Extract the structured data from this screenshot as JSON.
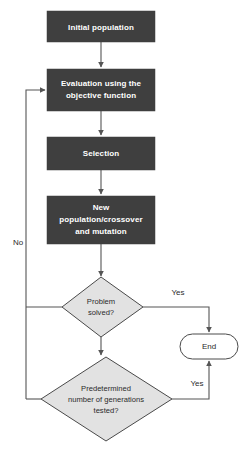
{
  "diagram": {
    "type": "flowchart",
    "colors": {
      "process_fill": "#3f3f3f",
      "process_text": "#ffffff",
      "decision_fill": "#e2e2e2",
      "decision_stroke": "#4a4a4a",
      "terminator_fill": "#ffffff",
      "edge": "#555555",
      "background": "#ffffff"
    },
    "nodes": {
      "initial_population": {
        "label": "Initial population",
        "shape": "process"
      },
      "evaluation": {
        "label_line1": "Evaluation using the",
        "label_line2": "objective function",
        "shape": "process"
      },
      "selection": {
        "label": "Selection",
        "shape": "process"
      },
      "new_population": {
        "label_line1": "New",
        "label_line2": "population/crossover",
        "label_line3": "and mutation",
        "shape": "process"
      },
      "problem_solved": {
        "label_line1": "Problem",
        "label_line2": "solved?",
        "shape": "decision"
      },
      "generations_tested": {
        "label_line1": "Predetermined",
        "label_line2": "number of generations",
        "label_line3": "tested?",
        "shape": "decision"
      },
      "end": {
        "label": "End",
        "shape": "terminator"
      }
    },
    "edge_labels": {
      "no": "No",
      "yes_problem_solved": "Yes",
      "yes_generations_tested": "Yes"
    }
  }
}
